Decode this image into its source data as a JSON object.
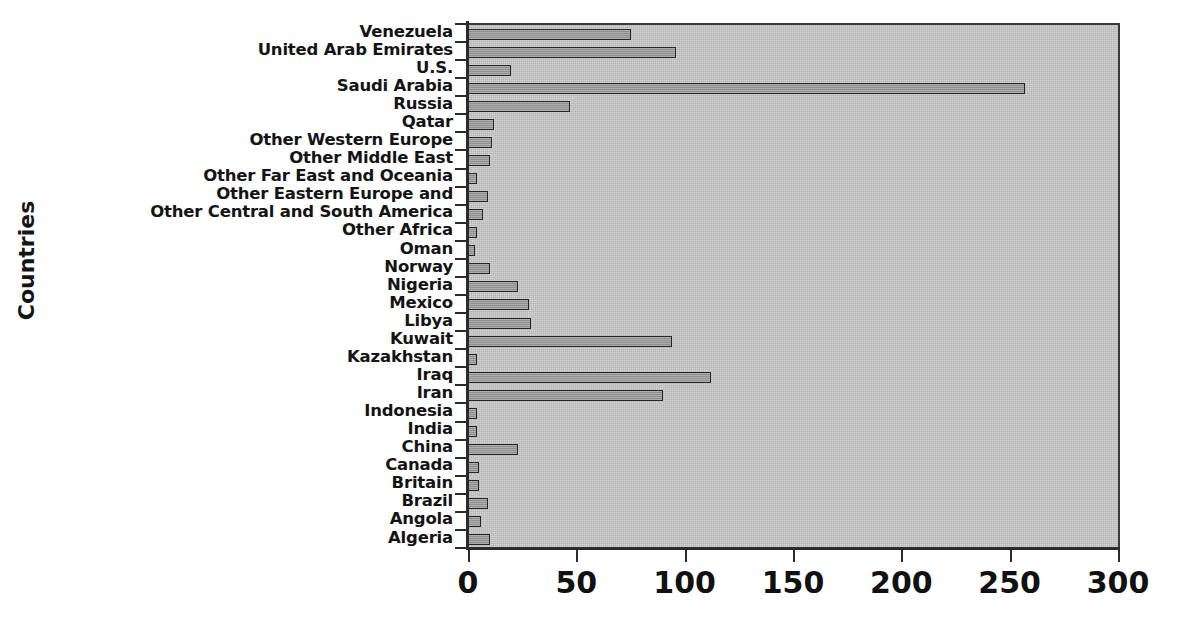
{
  "chart_data": {
    "type": "bar",
    "orientation": "horizontal",
    "title": "",
    "subtitle": "",
    "xlabel": "",
    "ylabel": "Countries",
    "xlim": [
      0,
      300
    ],
    "xticks": [
      0,
      50,
      100,
      150,
      200,
      250,
      300
    ],
    "grid": false,
    "legend": null,
    "plot_background_color": "#c8c8c8",
    "bar_fill_color": "#9b9b9b",
    "bar_border_color": "#262626",
    "axis_color": "#2b2b2b",
    "categories": [
      "Venezuela",
      "United Arab Emirates",
      "U.S.",
      "Saudi Arabia",
      "Russia",
      "Qatar",
      "Other Western Europe",
      "Other Middle East",
      "Other Far East and Oceania",
      "Other Eastern Europe and",
      "Other Central and South America",
      "Other Africa",
      "Oman",
      "Norway",
      "Nigeria",
      "Mexico",
      "Libya",
      "Kuwait",
      "Kazakhstan",
      "Iraq",
      "Iran",
      "Indonesia",
      "India",
      "China",
      "Canada",
      "Britain",
      "Brazil",
      "Angola",
      "Algeria"
    ],
    "values": [
      75,
      96,
      20,
      257,
      47,
      12,
      11,
      10,
      4,
      9,
      7,
      4,
      3,
      10,
      23,
      28,
      29,
      94,
      4,
      112,
      90,
      4,
      4,
      23,
      5,
      5,
      9,
      6,
      10
    ]
  }
}
